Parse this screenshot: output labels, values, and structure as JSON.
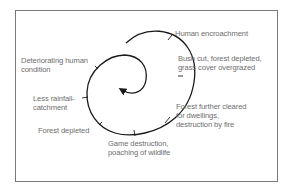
{
  "diagram": {
    "type": "spiral",
    "labels": {
      "human_encroachment": "Human encroachment",
      "bush_cut_1": "Bush cut, forest depleted,",
      "bush_cut_2": "grass cover overgrazed",
      "forest_cleared_1": "Forest further cleared",
      "forest_cleared_2": "for dwellings,",
      "forest_cleared_3": "destruction by fire",
      "game_destruction_1": "Game destruction,",
      "game_destruction_2": "poaching of wildlife",
      "forest_depleted": "Forest depleted",
      "less_rainfall_1": "Less rainfall-",
      "less_rainfall_2": "catchment",
      "deteriorating_1": "Deteriorating human",
      "deteriorating_2": "condition"
    },
    "stage_order": [
      "Human encroachment",
      "Bush cut, forest depleted, grass cover overgrazed",
      "Forest further cleared for dwellings, destruction by fire",
      "Game destruction, poaching of wildlife",
      "Forest depleted",
      "Less rainfall-catchment",
      "Deteriorating human condition"
    ],
    "colors": {
      "line": "#1a1a1a",
      "text": "#6e6e6e",
      "frame": "#7a7a7a"
    }
  }
}
